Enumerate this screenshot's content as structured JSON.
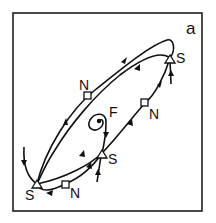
{
  "figure": {
    "panel_label": "a",
    "labels": {
      "saddle_top_right": "S",
      "node_upper_left": "N",
      "node_right": "N",
      "focus": "F",
      "saddle_middle": "S",
      "saddle_bottom_left": "S",
      "node_bottom": "N"
    },
    "colors": {
      "stroke": "#111111",
      "background": "#ffffff"
    }
  }
}
